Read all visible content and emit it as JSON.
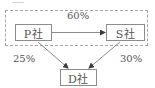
{
  "diagram": {
    "nodes": {
      "p": {
        "label": "P社"
      },
      "s": {
        "label": "S社"
      },
      "d": {
        "label": "D社"
      }
    },
    "edges": [
      {
        "from": "P社",
        "to": "S社",
        "label": "60%"
      },
      {
        "from": "P社",
        "to": "D社",
        "label": "25%"
      },
      {
        "from": "S社",
        "to": "D社",
        "label": "30%"
      }
    ],
    "group": {
      "members": [
        "P社",
        "S社"
      ],
      "style": "dashed"
    },
    "colors": {
      "line": "#6e6e6e",
      "box_border": "#8c8c8c",
      "dashed_border": "#a8a8a8",
      "text": "#555555"
    }
  }
}
